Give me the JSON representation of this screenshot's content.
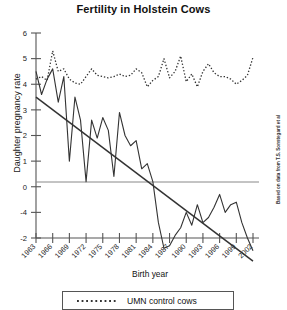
{
  "chart_data": {
    "type": "line",
    "title": "Fertility in Holstein Cows",
    "xlabel": "Birth year",
    "ylabel": "Daughter pregnancy rate",
    "credit": "Based on data from T.S. Sonstegard et al",
    "grid": false,
    "zero_line": true,
    "legend_position": "bottom",
    "xlim": [
      1963,
      2002
    ],
    "ylim": [
      -2,
      6
    ],
    "x_tick_labels": [
      "1963",
      "1966",
      "1969",
      "1972",
      "1975",
      "1978",
      "1981",
      "1984",
      "1987",
      "1990",
      "1993",
      "1996",
      "1999",
      "2002"
    ],
    "x_tick_values": [
      1963,
      1966,
      1969,
      1972,
      1975,
      1978,
      1981,
      1984,
      1987,
      1990,
      1993,
      1996,
      1999,
      2002
    ],
    "y_tick_labels": [
      "6",
      "5",
      "4",
      "3",
      "2",
      "1",
      "0",
      "-4",
      "-2"
    ],
    "y_tick_values": [
      6,
      5,
      4,
      3,
      2,
      1,
      0,
      -1,
      -2
    ],
    "series": [
      {
        "name": "UMN control cows",
        "style": "dotted",
        "color": "#333333",
        "in_legend": true,
        "x": [
          1963,
          1964,
          1965,
          1966,
          1967,
          1968,
          1969,
          1970,
          1971,
          1972,
          1973,
          1974,
          1975,
          1976,
          1977,
          1978,
          1979,
          1980,
          1981,
          1982,
          1983,
          1984,
          1985,
          1986,
          1987,
          1988,
          1989,
          1990,
          1991,
          1992,
          1993,
          1994,
          1995,
          1996,
          1997,
          1998,
          1999,
          2000,
          2001,
          2002
        ],
        "values": [
          4.2,
          4.3,
          4.15,
          5.3,
          4.5,
          4.6,
          4.2,
          4.05,
          4.0,
          4.3,
          4.6,
          4.35,
          4.3,
          4.25,
          4.3,
          4.4,
          4.3,
          4.35,
          4.6,
          4.45,
          3.9,
          4.15,
          4.3,
          5.0,
          4.25,
          4.5,
          5.1,
          4.1,
          4.4,
          3.9,
          4.5,
          4.8,
          4.45,
          4.3,
          4.3,
          4.2,
          4.0,
          4.15,
          4.35,
          5.05
        ]
      },
      {
        "name": "commercial cows",
        "style": "solid",
        "color": "#333333",
        "in_legend": false,
        "x": [
          1963,
          1964,
          1965,
          1966,
          1967,
          1968,
          1969,
          1970,
          1971,
          1972,
          1973,
          1974,
          1975,
          1976,
          1977,
          1978,
          1979,
          1980,
          1981,
          1982,
          1983,
          1984,
          1985,
          1986,
          1987,
          1988,
          1989,
          1990,
          1991,
          1992,
          1993,
          1994,
          1995,
          1996,
          1997,
          1998,
          1999,
          2000,
          2001,
          2002
        ],
        "values": [
          4.5,
          3.6,
          4.2,
          4.6,
          3.3,
          4.3,
          1.0,
          3.5,
          2.6,
          0.2,
          2.6,
          1.9,
          2.7,
          2.2,
          0.4,
          2.9,
          2.0,
          1.6,
          1.8,
          0.7,
          0.9,
          0.2,
          -1.4,
          -2.4,
          -2.3,
          -1.9,
          -1.6,
          -1.0,
          -1.5,
          -0.7,
          -1.4,
          -1.2,
          -0.8,
          -0.3,
          -1.0,
          -0.7,
          -0.6,
          -1.4,
          -2.0,
          -2.5
        ]
      },
      {
        "name": "trend line",
        "style": "trend",
        "color": "#333333",
        "in_legend": false,
        "x": [
          1963,
          2002
        ],
        "values": [
          3.5,
          -2.9
        ]
      }
    ],
    "legend": [
      {
        "label": "UMN control cows",
        "style": "dotted"
      }
    ]
  }
}
